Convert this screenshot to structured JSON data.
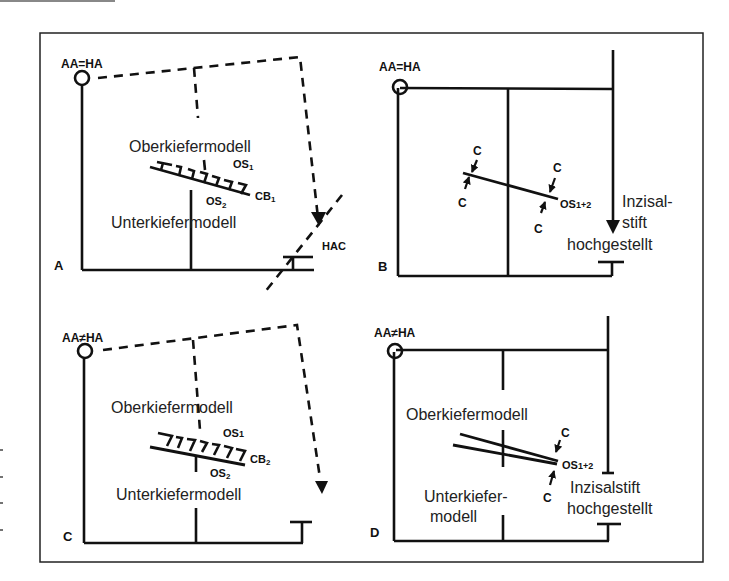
{
  "figure": {
    "panels": [
      {
        "id": "A",
        "letter": "A",
        "axis_label": "AA=HA",
        "upper_model": "Oberkiefermodell",
        "lower_model": "Unterkiefermodell",
        "os_top": "OS",
        "os_top_sub": "1",
        "os_bottom": "OS",
        "os_bottom_sub": "2",
        "cb": "CB",
        "cb_sub": "1",
        "hac": "HAC"
      },
      {
        "id": "B",
        "letter": "B",
        "axis_label": "AA=HA",
        "c_labels": [
          "C",
          "C",
          "C",
          "C"
        ],
        "os": "OS",
        "os_sub": "1+2",
        "pin_line1": "Inzisal-",
        "pin_line2": "stift",
        "pin_line3": "hochgestellt"
      },
      {
        "id": "C",
        "letter": "C",
        "axis_label": "AA≠HA",
        "upper_model": "Oberkiefermodell",
        "lower_model": "Unterkiefermodell",
        "os_top": "OS",
        "os_top_sub": "1",
        "os_bottom": "OS",
        "os_bottom_sub": "2",
        "cb": "CB",
        "cb_sub": "2"
      },
      {
        "id": "D",
        "letter": "D",
        "axis_label": "AA≠HA",
        "upper_model": "Oberkiefermodell",
        "lower_model_line1": "Unterkiefer-",
        "lower_model_line2": "modell",
        "c_labels": [
          "C",
          "C"
        ],
        "os": "OS",
        "os_sub": "1+2",
        "pin_line1": "Inzisalstift",
        "pin_line2": "hochgestellt"
      }
    ],
    "colors": {
      "ink": "#111111",
      "background": "#ffffff"
    }
  }
}
